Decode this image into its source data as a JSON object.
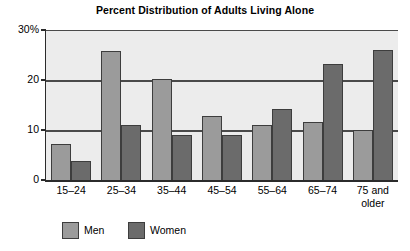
{
  "chart_data": {
    "type": "bar",
    "title": "Percent Distribution of Adults Living Alone",
    "xlabel": "",
    "ylabel": "",
    "ylim": [
      0,
      30
    ],
    "yticks": [
      {
        "value": 30,
        "label": "30%"
      },
      {
        "value": 20,
        "label": "20"
      },
      {
        "value": 10,
        "label": "10"
      },
      {
        "value": 0,
        "label": "0"
      }
    ],
    "grid": "horizontal",
    "legend_position": "bottom-left",
    "categories": [
      "15–24",
      "25–34",
      "35–44",
      "45–54",
      "55–64",
      "65–74",
      "75 and\nolder"
    ],
    "series": [
      {
        "name": "Men",
        "color": "#9b9b9b",
        "values": [
          7.5,
          26.0,
          20.4,
          13.0,
          11.3,
          11.9,
          10.3
        ]
      },
      {
        "name": "Women",
        "color": "#6b6b6b",
        "values": [
          4.0,
          11.3,
          9.2,
          9.2,
          14.5,
          23.4,
          26.2
        ]
      }
    ],
    "plot_background": "#ececec",
    "axis_color": "#2b2b2b"
  },
  "legend": {
    "items": [
      {
        "label": "Men",
        "swatch": "men"
      },
      {
        "label": "Women",
        "swatch": "women"
      }
    ]
  }
}
